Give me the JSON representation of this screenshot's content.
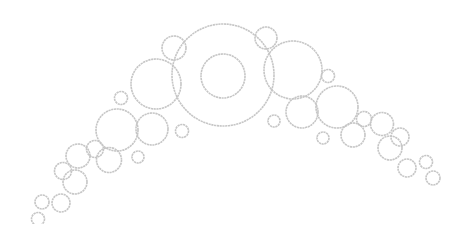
{
  "graphic": {
    "description": "Arc of outlined bubbles",
    "stroke_color": "#c6c6c6",
    "background": "#ffffff",
    "bubbles": [
      {
        "cx": 223,
        "cy": 75,
        "r": 51
      },
      {
        "cx": 223,
        "cy": 76,
        "r": 22
      },
      {
        "cx": 156,
        "cy": 84,
        "r": 25
      },
      {
        "cx": 174,
        "cy": 48,
        "r": 12
      },
      {
        "cx": 266,
        "cy": 38,
        "r": 11
      },
      {
        "cx": 293,
        "cy": 70,
        "r": 29
      },
      {
        "cx": 121,
        "cy": 98,
        "r": 6.5
      },
      {
        "cx": 328,
        "cy": 76,
        "r": 6.5
      },
      {
        "cx": 117,
        "cy": 130,
        "r": 21
      },
      {
        "cx": 152,
        "cy": 129,
        "r": 16
      },
      {
        "cx": 182,
        "cy": 131,
        "r": 6.5
      },
      {
        "cx": 138,
        "cy": 157,
        "r": 6
      },
      {
        "cx": 274,
        "cy": 121,
        "r": 6
      },
      {
        "cx": 302,
        "cy": 112,
        "r": 16
      },
      {
        "cx": 337,
        "cy": 107,
        "r": 21
      },
      {
        "cx": 364,
        "cy": 119,
        "r": 7.5
      },
      {
        "cx": 353,
        "cy": 135,
        "r": 12
      },
      {
        "cx": 323,
        "cy": 138,
        "r": 6
      },
      {
        "cx": 382,
        "cy": 124,
        "r": 11.5
      },
      {
        "cx": 400,
        "cy": 137,
        "r": 9
      },
      {
        "cx": 390,
        "cy": 148,
        "r": 12
      },
      {
        "cx": 407,
        "cy": 168,
        "r": 9
      },
      {
        "cx": 426,
        "cy": 162,
        "r": 6.5
      },
      {
        "cx": 433,
        "cy": 178,
        "r": 7
      },
      {
        "cx": 95,
        "cy": 149,
        "r": 8.5
      },
      {
        "cx": 78,
        "cy": 156,
        "r": 12
      },
      {
        "cx": 109,
        "cy": 160,
        "r": 12.5
      },
      {
        "cx": 63,
        "cy": 171,
        "r": 8.5
      },
      {
        "cx": 75,
        "cy": 182,
        "r": 12
      },
      {
        "cx": 61,
        "cy": 203,
        "r": 9
      },
      {
        "cx": 42,
        "cy": 202,
        "r": 7
      },
      {
        "cx": 38,
        "cy": 219,
        "r": 6.5
      }
    ]
  }
}
